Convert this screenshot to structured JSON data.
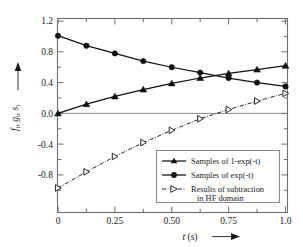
{
  "chart_data": {
    "type": "line",
    "title": "",
    "subtitle": "",
    "xlabel": "t (s)",
    "xlabel_italic_part": "t",
    "xlabel_rest": " (s)",
    "ylabel": "f i , g i , s i",
    "ylabel_parts": [
      "f",
      "i",
      ", ",
      "g",
      "i",
      ", ",
      "s",
      "i"
    ],
    "xlim": [
      -0.03,
      1.05
    ],
    "ylim": [
      -1.1,
      1.2
    ],
    "xticks": [
      0,
      0.25,
      0.5,
      0.75,
      1.0
    ],
    "xtick_labels": [
      "0",
      "0.25",
      "0.50",
      "0.75",
      "1.0"
    ],
    "xminor_ticks": [
      0.125,
      0.375,
      0.625,
      0.875
    ],
    "yticks": [
      1.2,
      0.8,
      0.4,
      0.0,
      -0.4,
      -0.8
    ],
    "ytick_labels": [
      "1.2",
      "0.8",
      "0.4",
      "0.0",
      "-0.4",
      "-0.8"
    ],
    "yminor_ticks": [
      1.0,
      0.6,
      0.2,
      -0.2,
      -0.6,
      -1.0
    ],
    "grid": false,
    "zero_line": true,
    "legend_position": "lower right",
    "x": [
      0.0,
      0.125,
      0.25,
      0.375,
      0.5,
      0.625,
      0.75,
      0.875,
      1.0
    ],
    "series": [
      {
        "name": "Samples of 1-exp(-t)",
        "marker": "triangle-up-filled",
        "linestyle": "solid",
        "values": [
          0.0,
          0.12,
          0.22,
          0.31,
          0.39,
          0.46,
          0.52,
          0.57,
          0.62
        ]
      },
      {
        "name": "Samples of exp(-t)",
        "marker": "circle-filled",
        "linestyle": "solid",
        "values": [
          1.01,
          0.88,
          0.78,
          0.68,
          0.6,
          0.53,
          0.46,
          0.4,
          0.35
        ]
      },
      {
        "name": "Results of subtraction in HF domain",
        "marker": "triangle-right-hollow",
        "linestyle": "dashdot",
        "values": [
          -0.97,
          -0.76,
          -0.56,
          -0.38,
          -0.22,
          -0.07,
          0.05,
          0.16,
          0.26
        ]
      }
    ],
    "legend_entries": [
      {
        "label_line1": "Samples of 1-exp(-t)",
        "label_line2": "",
        "marker": "triangle-up-filled",
        "linestyle": "solid"
      },
      {
        "label_line1": "Samples of exp(-t)",
        "label_line2": "",
        "marker": "circle-filled",
        "linestyle": "solid"
      },
      {
        "label_line1": "Results of subtraction",
        "label_line2": "in HF domain",
        "marker": "triangle-right-hollow",
        "linestyle": "dashdot"
      }
    ],
    "colors": {
      "line": "#111111",
      "frame": "#6f6f6f",
      "zero_line": "#8a8a8a",
      "background": "#ffffff",
      "text": "#1a1a1a"
    }
  }
}
